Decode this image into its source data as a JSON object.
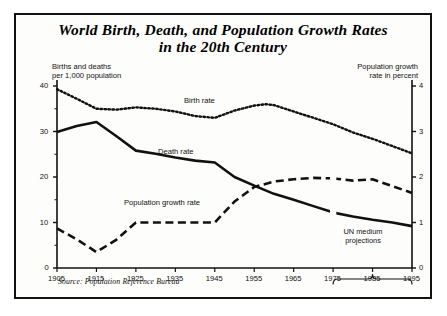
{
  "figure": {
    "title_line1": "World Birth, Death, and Population Growth Rates",
    "title_line2": "in the 20th Century",
    "left_axis_caption": "Births and deaths\nper 1,000 population",
    "right_axis_caption": "Population growth\nrate in percent",
    "annotation": "UN  medium\nprojections",
    "source": "Source:  Population Reference Bureau",
    "frame_color": "#111111"
  },
  "chart_data": {
    "type": "line",
    "title": "World Birth, Death, and Population Growth Rates in the 20th Century",
    "subtitle": "",
    "xlabel": "",
    "ylabel": "Births and deaths per 1,000 population",
    "y2label": "Population growth rate in percent",
    "xlim": [
      1905,
      1995
    ],
    "ylim": [
      0,
      40
    ],
    "y2lim": [
      0,
      4
    ],
    "grid": false,
    "legend": "inline-labels",
    "xticks": [
      1905,
      1915,
      1925,
      1935,
      1945,
      1955,
      1965,
      1975,
      1985,
      1995
    ],
    "xtick_labels": [
      "1905",
      "1915",
      "1925",
      "1935",
      "1945",
      "1955",
      "1965",
      "1975",
      "1985",
      "1995"
    ],
    "yticks": [
      0,
      10,
      20,
      30,
      40
    ],
    "ytick_labels": [
      "0",
      "10",
      "20",
      "30",
      "40"
    ],
    "y_minor_tick_step": 5,
    "y2ticks": [
      0,
      1,
      2,
      3,
      4
    ],
    "y2tick_labels": [
      "0",
      "1",
      "2",
      "3",
      "4"
    ],
    "projection_start_year": 1975,
    "projection_label": "UN medium projections",
    "series": [
      {
        "name": "Birth rate",
        "label": "Birth rate",
        "axis": "left",
        "style": "dotted",
        "units": "per 1,000 population",
        "x": [
          1905,
          1910,
          1915,
          1920,
          1925,
          1930,
          1935,
          1940,
          1945,
          1950,
          1955,
          1958,
          1960,
          1965,
          1970,
          1975,
          1980,
          1985,
          1990,
          1995
        ],
        "values": [
          39.3,
          37.2,
          35.0,
          34.8,
          35.3,
          35.0,
          34.4,
          33.4,
          33.0,
          34.6,
          35.7,
          36.0,
          35.8,
          34.4,
          33.0,
          31.6,
          29.8,
          28.4,
          26.8,
          25.2
        ]
      },
      {
        "name": "Death rate",
        "label": "Death rate",
        "axis": "left",
        "style": "solid",
        "units": "per 1,000 population",
        "x": [
          1905,
          1910,
          1915,
          1920,
          1925,
          1930,
          1935,
          1940,
          1945,
          1950,
          1955,
          1960,
          1965,
          1970,
          1975,
          1980,
          1985,
          1990,
          1995
        ],
        "values": [
          29.9,
          31.2,
          32.1,
          29.0,
          25.8,
          25.1,
          24.3,
          23.6,
          23.2,
          20.0,
          18.1,
          16.3,
          15.0,
          13.6,
          12.2,
          11.3,
          10.6,
          10.0,
          9.2
        ]
      },
      {
        "name": "Population growth rate",
        "label": "Population growth rate",
        "axis": "right",
        "style": "dashed",
        "units": "percent",
        "x": [
          1905,
          1910,
          1915,
          1920,
          1925,
          1930,
          1935,
          1940,
          1945,
          1950,
          1955,
          1960,
          1965,
          1970,
          1975,
          1980,
          1985,
          1990,
          1995
        ],
        "values": [
          0.87,
          0.63,
          0.35,
          0.62,
          1.0,
          1.0,
          1.0,
          1.0,
          1.0,
          1.46,
          1.78,
          1.9,
          1.95,
          1.98,
          1.97,
          1.92,
          1.95,
          1.8,
          1.65
        ]
      }
    ]
  }
}
